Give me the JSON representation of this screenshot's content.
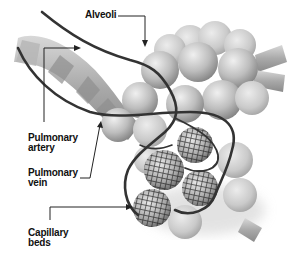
{
  "diagram": {
    "style": "grayscale 3D illustration",
    "labels": {
      "alveoli": "Alveoli",
      "pulmonary_artery": [
        "Pulmonary",
        "artery"
      ],
      "pulmonary_vein": [
        "Pulmonary",
        "vein"
      ],
      "capillary_beds": [
        "Capillary",
        "beds"
      ]
    },
    "colors": {
      "background": "#ffffff",
      "label_text": "#111111",
      "leader_line": "#222222",
      "vessel": "#333333",
      "sphere_light": "#e6e6e6",
      "sphere_dark": "#8a8a8a",
      "capillary_mesh": "#1e1e1e"
    }
  }
}
